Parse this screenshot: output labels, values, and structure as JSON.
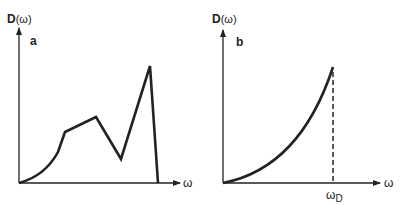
{
  "panels": [
    {
      "id": "a",
      "panel_label": "a",
      "y_axis_label_main": "D",
      "y_axis_label_arg": "(ω)",
      "x_axis_label": "ω",
      "description": "Density of states D(ω) of a real crystal: rises as ω² at low frequency, with van Hove singularities (kinks, peak) and cutoff at maximum frequency"
    },
    {
      "id": "b",
      "panel_label": "b",
      "y_axis_label_main": "D",
      "y_axis_label_arg": "(ω)",
      "x_axis_label": "ω",
      "cutoff_label_main": "ω",
      "cutoff_label_sub": "D",
      "description": "Debye model density of states: D(ω) ∝ ω² up to the Debye cutoff frequency ω_D, zero beyond"
    }
  ],
  "colors": {
    "line": "#222222",
    "background": "#ffffff"
  }
}
